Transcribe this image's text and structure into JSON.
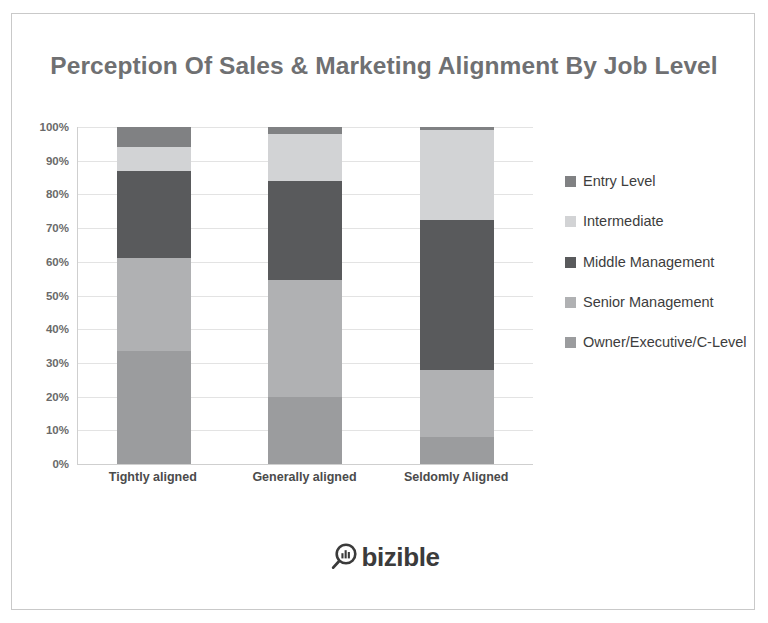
{
  "chart": {
    "title": "Perception Of Sales & Marketing Alignment By Job Level",
    "logo_text": "bizible",
    "logo_icon": "magnifier-bar-chart-icon"
  },
  "chart_data": {
    "type": "bar",
    "stacked": true,
    "orientation": "vertical",
    "title": "Perception Of Sales & Marketing Alignment By Job Level",
    "xlabel": "",
    "ylabel": "",
    "ylim": [
      0,
      100
    ],
    "grid": true,
    "legend_position": "right",
    "categories": [
      "Tightly aligned",
      "Generally aligned",
      "Seldomly Aligned"
    ],
    "ticklabels_y": [
      "0%",
      "10%",
      "20%",
      "30%",
      "40%",
      "50%",
      "60%",
      "70%",
      "80%",
      "90%",
      "100%"
    ],
    "tickvalues_y": [
      0,
      10,
      20,
      30,
      40,
      50,
      60,
      70,
      80,
      90,
      100
    ],
    "series": [
      {
        "name": "Entry Level",
        "color": "#808183",
        "values": [
          6,
          2,
          1
        ]
      },
      {
        "name": "Intermediate",
        "color": "#d2d3d5",
        "values": [
          7,
          14,
          26.5
        ]
      },
      {
        "name": "Middle Management",
        "color": "#595a5c",
        "values": [
          26,
          29.5,
          44.5
        ]
      },
      {
        "name": "Senior Management",
        "color": "#b0b1b3",
        "values": [
          27.5,
          34.5,
          20
        ]
      },
      {
        "name": "Owner/Executive/C-Level",
        "color": "#9b9c9e",
        "values": [
          33.5,
          20,
          8
        ]
      }
    ]
  },
  "legend": {
    "items": [
      {
        "label": "Entry Level",
        "color": "#808183"
      },
      {
        "label": "Intermediate",
        "color": "#d2d3d5"
      },
      {
        "label": "Middle Management",
        "color": "#595a5c"
      },
      {
        "label": "Senior Management",
        "color": "#b0b1b3"
      },
      {
        "label": "Owner/Executive/C-Level",
        "color": "#9b9c9e"
      }
    ]
  }
}
